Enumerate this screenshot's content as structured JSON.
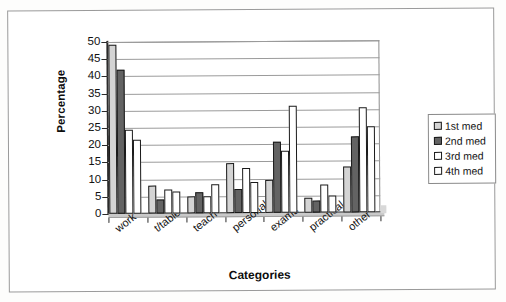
{
  "chart_data": {
    "type": "bar",
    "title": "",
    "xlabel": "Categories",
    "ylabel": "Percentage",
    "ylim": [
      0,
      50
    ],
    "yticks": [
      0,
      5,
      10,
      15,
      20,
      25,
      30,
      35,
      40,
      45,
      50
    ],
    "grid": true,
    "legend_position": "right",
    "categories": [
      "work",
      "t/table",
      "teach",
      "personal",
      "exams",
      "practical",
      "other"
    ],
    "series": [
      {
        "name": "1st med",
        "color": "#d4d4d4",
        "values": [
          49,
          8,
          5,
          14.5,
          9.5,
          4.5,
          13.5
        ]
      },
      {
        "name": "2nd med",
        "color": "#636363",
        "values": [
          42,
          4,
          6,
          7,
          20.5,
          3.5,
          22
        ]
      },
      {
        "name": "3rd med",
        "color": "#ffffff",
        "values": [
          24.5,
          7,
          5,
          13,
          18,
          8,
          30.5
        ]
      },
      {
        "name": "4th med",
        "color": "#ffffff",
        "values": [
          21.5,
          6.5,
          8.5,
          9,
          31,
          5,
          25
        ]
      }
    ]
  },
  "axes": {
    "y_title": "Percentage",
    "x_title": "Categories"
  },
  "legend": {
    "items": [
      {
        "label": "1st med"
      },
      {
        "label": "2nd med"
      },
      {
        "label": "3rd med"
      },
      {
        "label": "4th med"
      }
    ]
  }
}
